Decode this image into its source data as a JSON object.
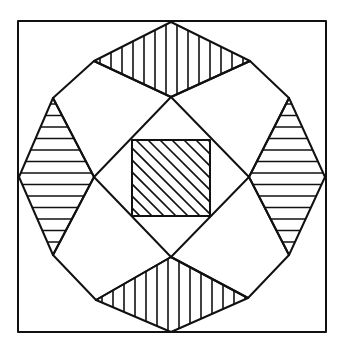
{
  "diagram": {
    "colors": {
      "stroke": "#111111",
      "background": "#ffffff"
    },
    "frame": {
      "x1": 18,
      "y1": 21,
      "x2": 326,
      "y2": 332
    },
    "center_square": {
      "x1": 132,
      "y1": 140,
      "x2": 210,
      "y2": 216,
      "hatch": "diagonal"
    },
    "triangles": [
      {
        "id": "top",
        "points": [
          [
            94,
            61
          ],
          [
            171,
            22
          ],
          [
            250,
            61
          ],
          [
            171,
            97
          ]
        ],
        "hatch": "vertical"
      },
      {
        "id": "left",
        "points": [
          [
            53,
            98
          ],
          [
            19,
            177
          ],
          [
            53,
            255
          ],
          [
            94,
            177
          ]
        ],
        "hatch": "horizontal"
      },
      {
        "id": "right",
        "points": [
          [
            289,
            98
          ],
          [
            325,
            177
          ],
          [
            289,
            255
          ],
          [
            249,
            177
          ]
        ],
        "hatch": "horizontal"
      },
      {
        "id": "bottom",
        "points": [
          [
            96,
            300
          ],
          [
            171,
            332
          ],
          [
            248,
            298
          ],
          [
            171,
            257
          ]
        ],
        "hatch": "vertical"
      }
    ],
    "quads": [
      {
        "id": "top-left",
        "points": [
          [
            53,
            98
          ],
          [
            94,
            61
          ],
          [
            171,
            97
          ],
          [
            94,
            177
          ]
        ]
      },
      {
        "id": "top-right",
        "points": [
          [
            171,
            97
          ],
          [
            250,
            61
          ],
          [
            289,
            98
          ],
          [
            249,
            177
          ]
        ]
      },
      {
        "id": "bottom-left",
        "points": [
          [
            53,
            255
          ],
          [
            94,
            177
          ],
          [
            171,
            257
          ],
          [
            96,
            300
          ]
        ]
      },
      {
        "id": "bottom-right",
        "points": [
          [
            249,
            177
          ],
          [
            289,
            255
          ],
          [
            248,
            298
          ],
          [
            171,
            257
          ]
        ]
      }
    ]
  }
}
